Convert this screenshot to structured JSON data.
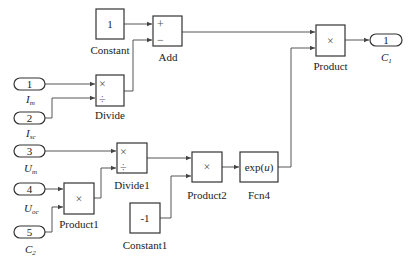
{
  "diagram": {
    "type": "simulink-block-diagram",
    "blocks": {
      "constant": {
        "name": "Constant",
        "value": "1"
      },
      "constant1": {
        "name": "Constant1",
        "value": "-1"
      },
      "add": {
        "name": "Add",
        "signs": [
          "+",
          "−"
        ]
      },
      "divide": {
        "name": "Divide",
        "ops": [
          "×",
          "÷"
        ]
      },
      "divide1": {
        "name": "Divide1",
        "ops": [
          "×",
          "÷"
        ]
      },
      "product": {
        "name": "Product",
        "op": "×"
      },
      "product1": {
        "name": "Product1",
        "op": "×"
      },
      "product2": {
        "name": "Product2",
        "op": "×"
      },
      "fcn4": {
        "name": "Fcn4",
        "expr_pre": "exp(",
        "expr_var": "u",
        "expr_post": ")"
      }
    },
    "inports": [
      {
        "num": "1",
        "label_main": "I",
        "label_sub": "m"
      },
      {
        "num": "2",
        "label_main": "I",
        "label_sub": "sc"
      },
      {
        "num": "3",
        "label_main": "U",
        "label_sub": "m"
      },
      {
        "num": "4",
        "label_main": "U",
        "label_sub": "oc"
      },
      {
        "num": "5",
        "label_main": "C",
        "label_sub": "2"
      }
    ],
    "outports": [
      {
        "num": "1",
        "label_main": "C",
        "label_sub": "1"
      }
    ],
    "connections": [
      "Constant -> Add(+)",
      "Divide -> Add(-)",
      "In1 (I_m) -> Divide(×)",
      "In2 (I_sc) -> Divide(÷)",
      "Add -> Product(in1)",
      "Fcn4 -> Product(in2)",
      "Product -> Out1 (C_1)",
      "In3 (U_m) -> Divide1(×)",
      "Product1 -> Divide1(÷)",
      "In4 (U_oc) -> Product1(in1)",
      "In5 (C_2) -> Product1(in2)",
      "Divide1 -> Product2(in1)",
      "Constant1 -> Product2(in2)",
      "Product2 -> Fcn4"
    ]
  }
}
